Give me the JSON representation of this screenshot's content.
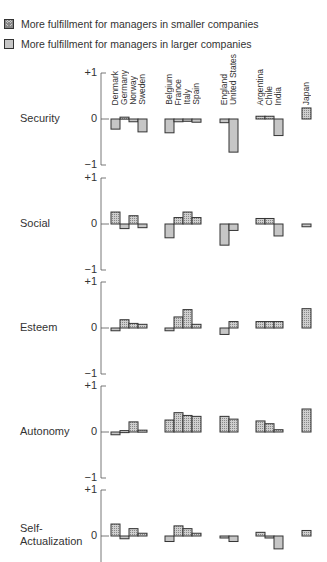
{
  "legend": {
    "smaller": "More fulfillment for managers in smaller companies",
    "larger": "More fulfillment for managers in larger companies"
  },
  "chart_data": {
    "type": "bar",
    "title": "",
    "xlabel": "",
    "ylabel": "",
    "ylim": [
      -1,
      1
    ],
    "y_ticks": [
      "+1",
      "0",
      "-1"
    ],
    "legend": [
      {
        "name": "More fulfillment for managers in smaller companies",
        "style": "hatched",
        "sign": "positive"
      },
      {
        "name": "More fulfillment for managers in larger companies",
        "style": "plain",
        "sign": "negative"
      }
    ],
    "groups": [
      {
        "name": "Nordic/Germanic",
        "countries": [
          "Denmark",
          "Germany",
          "Norway",
          "Sweden"
        ]
      },
      {
        "name": "Latin-European",
        "countries": [
          "Belgium",
          "France",
          "Italy",
          "Spain"
        ]
      },
      {
        "name": "Anglo-American",
        "countries": [
          "England",
          "United States"
        ]
      },
      {
        "name": "Developing",
        "countries": [
          "Argentina",
          "Chile",
          "India"
        ]
      },
      {
        "name": "Japan",
        "countries": [
          "Japan"
        ]
      }
    ],
    "categories": [
      "Denmark",
      "Germany",
      "Norway",
      "Sweden",
      "Belgium",
      "France",
      "Italy",
      "Spain",
      "England",
      "United States",
      "Argentina",
      "Chile",
      "India",
      "Japan"
    ],
    "series": [
      {
        "name": "Security",
        "values": [
          -0.22,
          0.04,
          -0.06,
          -0.28,
          -0.3,
          -0.06,
          -0.05,
          -0.07,
          -0.08,
          -0.72,
          0.06,
          0.06,
          -0.36,
          0.24
        ]
      },
      {
        "name": "Social",
        "values": [
          0.26,
          -0.1,
          0.18,
          -0.08,
          -0.3,
          0.14,
          0.26,
          0.14,
          -0.46,
          -0.14,
          0.12,
          0.12,
          -0.26,
          -0.06
        ]
      },
      {
        "name": "Esteem",
        "values": [
          -0.06,
          0.18,
          0.1,
          0.08,
          -0.06,
          0.24,
          0.4,
          0.08,
          -0.14,
          0.14,
          0.14,
          0.14,
          0.14,
          0.42
        ]
      },
      {
        "name": "Autonomy",
        "values": [
          -0.06,
          0.03,
          0.22,
          0.04,
          0.26,
          0.42,
          0.36,
          0.34,
          0.34,
          0.28,
          0.24,
          0.18,
          0.05,
          0.5
        ]
      },
      {
        "name": "Self-Actualization",
        "values": [
          0.26,
          -0.06,
          0.16,
          0.06,
          -0.12,
          0.22,
          0.16,
          0.06,
          -0.04,
          -0.12,
          0.08,
          -0.04,
          -0.28,
          0.12
        ]
      }
    ]
  },
  "panels": [
    {
      "label": "Security"
    },
    {
      "label": "Social"
    },
    {
      "label": "Esteem"
    },
    {
      "label": "Autonomy"
    },
    {
      "label": "Self-\nActualization"
    }
  ]
}
